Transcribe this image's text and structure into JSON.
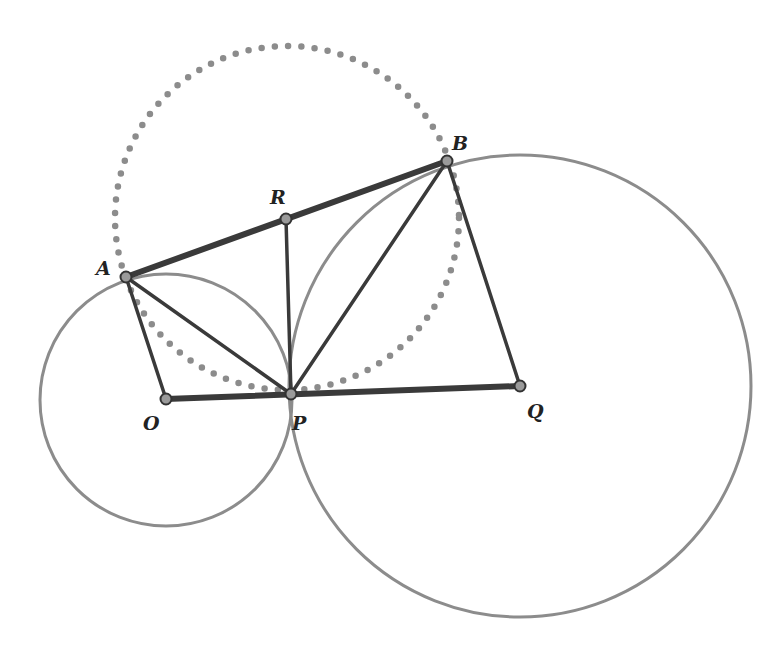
{
  "figure": {
    "type": "geometry-diagram",
    "colors": {
      "circle_stroke": "#8c8c8c",
      "dotted_circle": "#8c8c8c",
      "segment_stroke": "#3a3a3a",
      "point_fill": "#9a9a9a",
      "point_stroke": "#333333",
      "label": "#222222"
    },
    "points": [
      {
        "name": "A",
        "x": 126,
        "y": 277,
        "label": "A",
        "lx": 96,
        "ly": 275
      },
      {
        "name": "B",
        "x": 447,
        "y": 161,
        "label": "B",
        "lx": 452,
        "ly": 150
      },
      {
        "name": "R",
        "x": 286,
        "y": 219,
        "label": "R",
        "lx": 270,
        "ly": 204
      },
      {
        "name": "O",
        "x": 166,
        "y": 399,
        "label": "O",
        "lx": 143,
        "ly": 430
      },
      {
        "name": "P",
        "x": 291,
        "y": 394,
        "label": "P",
        "lx": 292,
        "ly": 430
      },
      {
        "name": "Q",
        "x": 520,
        "y": 386,
        "label": "Q",
        "lx": 527,
        "ly": 418
      }
    ],
    "circles": [
      {
        "name": "circle-O",
        "cx": 166,
        "cy": 400,
        "r": 126,
        "style": "solid"
      },
      {
        "name": "circle-Q",
        "cx": 520,
        "cy": 386,
        "r": 231,
        "style": "solid"
      },
      {
        "name": "circle-R",
        "cx": 287,
        "cy": 218,
        "r": 172,
        "style": "dotted"
      }
    ],
    "segments": [
      {
        "from": "A",
        "to": "B",
        "weight": "thick"
      },
      {
        "from": "O",
        "to": "Q",
        "weight": "thick"
      },
      {
        "from": "A",
        "to": "O",
        "weight": "medium"
      },
      {
        "from": "A",
        "to": "P",
        "weight": "medium"
      },
      {
        "from": "R",
        "to": "P",
        "weight": "medium"
      },
      {
        "from": "B",
        "to": "P",
        "weight": "medium"
      },
      {
        "from": "B",
        "to": "Q",
        "weight": "medium"
      }
    ]
  }
}
